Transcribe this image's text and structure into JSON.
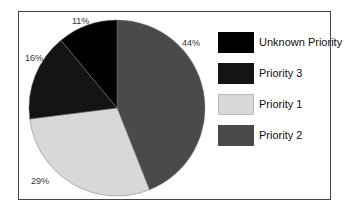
{
  "chart_data": {
    "type": "pie",
    "title": "",
    "categories": [
      "Priority 2",
      "Priority 1",
      "Priority 3",
      "Unknown Priority"
    ],
    "values": [
      44,
      29,
      16,
      11
    ],
    "labels": [
      "44%",
      "29%",
      "16%",
      "11%"
    ],
    "colors": [
      "#4a4a4a",
      "#d8d8d8",
      "#141414",
      "#000000"
    ],
    "start_angle": "top, clockwise",
    "legend": {
      "position": "right",
      "entries": [
        {
          "label": "Unknown Priority",
          "color": "#000000"
        },
        {
          "label": "Priority 3",
          "color": "#141414"
        },
        {
          "label": "Priority 1",
          "color": "#d8d8d8"
        },
        {
          "label": "Priority 2",
          "color": "#4a4a4a"
        }
      ]
    }
  }
}
